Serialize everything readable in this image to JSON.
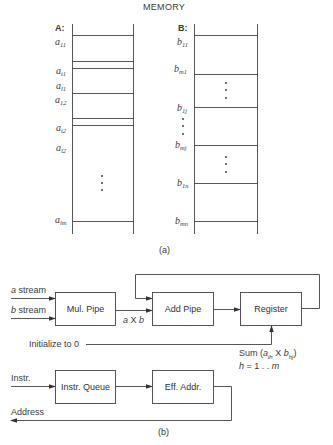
{
  "title": "MEMORY",
  "part_a": {
    "caption": "(a)",
    "array_a": {
      "header": "A:",
      "labels": [
        {
          "base": "a",
          "sub": "11"
        },
        {
          "base": "a",
          "sub": "i1"
        },
        {
          "base": "a",
          "sub": "l1"
        },
        {
          "base": "a",
          "sub": "12"
        },
        {
          "base": "a",
          "sub": "i2"
        },
        {
          "base": "a",
          "sub": "l2"
        },
        {
          "base": "a",
          "sub": "lm"
        }
      ]
    },
    "array_b": {
      "header": "B:",
      "labels": [
        {
          "base": "b",
          "sub": "11"
        },
        {
          "base": "b",
          "sub": "m1"
        },
        {
          "base": "b",
          "sub": "1j"
        },
        {
          "base": "b",
          "sub": "mj"
        },
        {
          "base": "b",
          "sub": "1n"
        },
        {
          "base": "b",
          "sub": "mn"
        }
      ]
    }
  },
  "part_b": {
    "caption": "(b)",
    "inputs": {
      "a_stream": {
        "var": "a",
        "text": " stream"
      },
      "b_stream": {
        "var": "b",
        "text": " stream"
      },
      "instr": "Instr.",
      "initialize": "Initialize to 0"
    },
    "boxes": {
      "mul_pipe": "Mul. Pipe",
      "add_pipe": "Add Pipe",
      "register": "Register",
      "instr_queue": "Instr. Queue",
      "eff_addr": "Eff. Addr."
    },
    "product_label": {
      "a": "a",
      "op": " X ",
      "b": "b"
    },
    "sum_label": {
      "prefix": "Sum (",
      "a": "a",
      "a_sub": "ih",
      "op": " X ",
      "b": "b",
      "b_sub": "hj",
      "suffix": ")"
    },
    "range_label": {
      "h": "h",
      "rest": " = 1 . . ",
      "m": "m"
    },
    "output": "Address"
  }
}
